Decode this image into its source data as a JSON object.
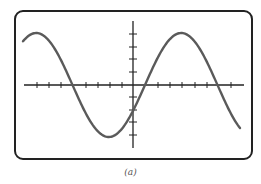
{
  "figure": {
    "caption": "(a)",
    "frame": {
      "x": 15,
      "y": 11,
      "width": 237,
      "height": 148,
      "radius": 8,
      "stroke": "#222222"
    },
    "axes": {
      "origin": {
        "x": 133,
        "y": 85
      },
      "h_axis": {
        "x1": 24,
        "x2": 244
      },
      "v_axis": {
        "y1": 21,
        "y2": 148
      },
      "h_ticks": [
        37,
        49,
        61,
        86,
        98,
        110,
        122,
        158,
        170,
        182,
        195,
        207,
        231
      ],
      "v_ticks": [
        34,
        47,
        59,
        72,
        97,
        110,
        122,
        135
      ],
      "tick_half": 3,
      "color": "#222222"
    },
    "curve": {
      "type": "sine",
      "x_start": 23,
      "x_end": 240,
      "baseline_y": 85,
      "amplitude_px": 52,
      "period_px": 145,
      "zero_cross_x": 145,
      "color": "#5a5a5a",
      "width": 2.4
    }
  },
  "chart_data": {
    "type": "line",
    "title": "",
    "caption": "(a)",
    "xlabel": "",
    "ylabel": "",
    "x_ticks_per_side": 10,
    "y_ticks_per_side": 4,
    "series": [
      {
        "name": "sine wave",
        "function": "y = A*sin(2*pi*(x - x0)/T)",
        "amplitude_ticks": 4.1,
        "period_ticks": 11.7,
        "phase_offset_ticks": 1
      }
    ],
    "grid": false,
    "legend": null
  }
}
